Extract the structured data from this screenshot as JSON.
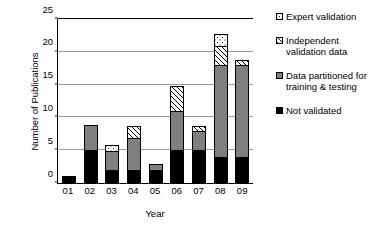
{
  "chart_data": {
    "type": "bar",
    "stacked": true,
    "title": "",
    "xlabel": "Year",
    "ylabel": "Number of Publications",
    "categories": [
      "01",
      "02",
      "03",
      "04",
      "05",
      "06",
      "07",
      "08",
      "09"
    ],
    "ylim": [
      0,
      25
    ],
    "yticks": [
      0,
      5,
      10,
      15,
      20,
      25
    ],
    "grid": "horizontal",
    "legend_position": "right",
    "series": [
      {
        "name": "Not validated",
        "pattern": "solid-black",
        "color": "#000000",
        "values": [
          1,
          5,
          2,
          2,
          2,
          5,
          5,
          4,
          4
        ]
      },
      {
        "name": "Data partitioned for\ntraining & testing",
        "pattern": "solid-gray",
        "color": "#7f7f7f",
        "values": [
          0,
          4,
          3,
          5,
          1,
          6,
          3,
          14,
          14
        ]
      },
      {
        "name": "Independent\nvalidation data",
        "pattern": "diagonal-hatch",
        "color": "#ffffff",
        "values": [
          0,
          0,
          0,
          2,
          0,
          4,
          1,
          3,
          1
        ]
      },
      {
        "name": "Expert validation",
        "pattern": "dotted",
        "color": "#ffffff",
        "values": [
          0,
          0,
          1,
          0,
          0,
          0,
          0,
          2,
          0
        ]
      }
    ],
    "totals": [
      1,
      9,
      6,
      9,
      3,
      15,
      9,
      23,
      19
    ]
  },
  "legend": {
    "items": [
      {
        "label": "Expert validation",
        "pattern": "dotted"
      },
      {
        "label": "Independent\nvalidation data",
        "pattern": "diagonal-hatch"
      },
      {
        "label": "Data partitioned for\ntraining & testing",
        "pattern": "solid-gray"
      },
      {
        "label": "Not validated",
        "pattern": "solid-black"
      }
    ]
  }
}
